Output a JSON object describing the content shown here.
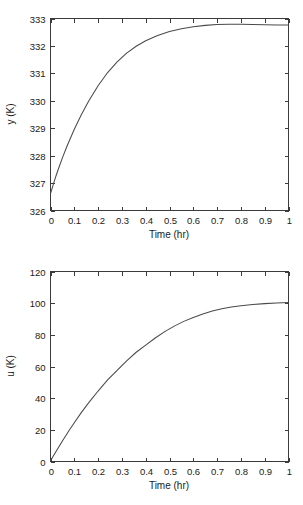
{
  "figure": {
    "background_color": "#ffffff",
    "line_color": "#4a4a4a",
    "axis_color": "#3b3b3b"
  },
  "chart_data": [
    {
      "id": "top",
      "type": "line",
      "title": "",
      "xlabel": "Time (hr)",
      "ylabel": "y (K)",
      "xlim": [
        0,
        1
      ],
      "ylim": [
        326,
        333
      ],
      "xticks": [
        0,
        0.1,
        0.2,
        0.3,
        0.4,
        0.5,
        0.6,
        0.7,
        0.8,
        0.9,
        1
      ],
      "xticklabels": [
        "0",
        "0.1",
        "0.2",
        "0.3",
        "0.4",
        "0.5",
        "0.6",
        "0.7",
        "0.8",
        "0.9",
        "1"
      ],
      "yticks": [
        326,
        327,
        328,
        329,
        330,
        331,
        332,
        333
      ],
      "yticklabels": [
        "326",
        "327",
        "328",
        "329",
        "330",
        "331",
        "332",
        "333"
      ],
      "grid": false,
      "legend": null,
      "series": [
        {
          "name": "y",
          "x": [
            0.0,
            0.01,
            0.02,
            0.03,
            0.05,
            0.07,
            0.1,
            0.13,
            0.16,
            0.2,
            0.24,
            0.28,
            0.32,
            0.36,
            0.4,
            0.45,
            0.5,
            0.55,
            0.6,
            0.65,
            0.7,
            0.75,
            0.8,
            0.85,
            0.9,
            0.95,
            1.0
          ],
          "y": [
            326.62,
            326.9,
            327.18,
            327.44,
            327.92,
            328.36,
            328.96,
            329.5,
            329.98,
            330.55,
            331.03,
            331.42,
            331.74,
            331.99,
            332.19,
            332.38,
            332.53,
            332.63,
            332.7,
            332.75,
            332.78,
            332.79,
            332.79,
            332.78,
            332.77,
            332.76,
            332.76
          ]
        }
      ]
    },
    {
      "id": "bottom",
      "type": "line",
      "title": "",
      "xlabel": "Time (hr)",
      "ylabel": "u (K)",
      "xlim": [
        0,
        1
      ],
      "ylim": [
        0,
        120
      ],
      "xticks": [
        0,
        0.1,
        0.2,
        0.3,
        0.4,
        0.5,
        0.6,
        0.7,
        0.8,
        0.9,
        1
      ],
      "xticklabels": [
        "0",
        "0.1",
        "0.2",
        "0.3",
        "0.4",
        "0.5",
        "0.6",
        "0.7",
        "0.8",
        "0.9",
        "1"
      ],
      "yticks": [
        0,
        20,
        40,
        60,
        80,
        100,
        120
      ],
      "yticklabels": [
        "0",
        "20",
        "40",
        "60",
        "80",
        "100",
        "120"
      ],
      "grid": false,
      "legend": null,
      "series": [
        {
          "name": "u",
          "x": [
            0.0,
            0.02,
            0.05,
            0.08,
            0.1,
            0.13,
            0.16,
            0.2,
            0.24,
            0.28,
            0.32,
            0.36,
            0.4,
            0.44,
            0.48,
            0.52,
            0.56,
            0.6,
            0.64,
            0.68,
            0.72,
            0.76,
            0.8,
            0.85,
            0.9,
            0.95,
            1.0
          ],
          "y": [
            0.5,
            5.5,
            13.0,
            20.0,
            24.5,
            31.0,
            37.0,
            44.5,
            51.5,
            57.5,
            63.5,
            69.0,
            73.5,
            78.0,
            82.0,
            85.5,
            88.5,
            91.0,
            93.2,
            95.0,
            96.5,
            97.6,
            98.4,
            99.2,
            99.7,
            100.1,
            100.4
          ]
        }
      ]
    }
  ]
}
